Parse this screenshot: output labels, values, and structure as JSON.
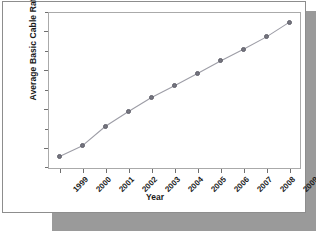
{
  "panel": {
    "background_color": "#ffffff",
    "border_color": "#8d8d8d",
    "shadow_color": "#9a9a9a"
  },
  "chart_data": {
    "type": "line",
    "title": "",
    "xlabel": "Year",
    "ylabel": "Average Basic Cable Rate",
    "categories": [
      "1999",
      "2000",
      "2001",
      "2002",
      "2003",
      "2004",
      "2005",
      "2006",
      "2007",
      "2008",
      "2009"
    ],
    "values": [
      28.9,
      30.3,
      32.8,
      34.7,
      36.5,
      38.0,
      39.6,
      41.2,
      42.7,
      44.3,
      46.2
    ],
    "y_tick_labels": [
      "$45",
      "$40",
      "$35",
      "$30"
    ],
    "y_tick_values": [
      45,
      40,
      35,
      30
    ],
    "y_minor_tick_values": [
      47.5,
      42.5,
      37.5,
      32.5,
      27.5
    ],
    "ylim": [
      27.3,
      47.5
    ],
    "xlim": [
      -0.5,
      10.5
    ],
    "grid": false,
    "legend": false,
    "marker_color": "#75757f",
    "line_color": "#9d9da6",
    "axis_color": "#aaaaaa",
    "text_color": "#1a1a1a",
    "x_tick_label_rotation": -45
  }
}
